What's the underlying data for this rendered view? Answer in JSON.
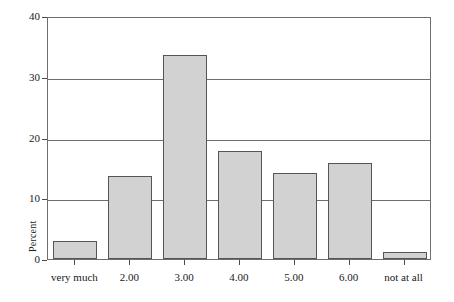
{
  "chart_data": {
    "type": "bar",
    "title": "",
    "subtitle": "",
    "xlabel": "",
    "ylabel": "Percent",
    "categories": [
      "very much",
      "2.00",
      "3.00",
      "4.00",
      "5.00",
      "6.00",
      "not at all"
    ],
    "values": [
      3.0,
      13.6,
      33.6,
      17.7,
      14.2,
      15.8,
      1.2
    ],
    "ylim": [
      0,
      40
    ],
    "yticks": [
      0,
      10,
      20,
      30,
      40
    ],
    "ytick_labels": [
      "0",
      "10",
      "20",
      "30",
      "40"
    ],
    "grid": "horizontal",
    "legend": "none",
    "annotations": [],
    "colors": {
      "bar_fill": "#d2d2d2",
      "bar_border": "#555555",
      "grid": "#6e6e6e",
      "frame": "#6e6e6e",
      "text": "#1a1a1a",
      "background": "#ffffff"
    }
  }
}
